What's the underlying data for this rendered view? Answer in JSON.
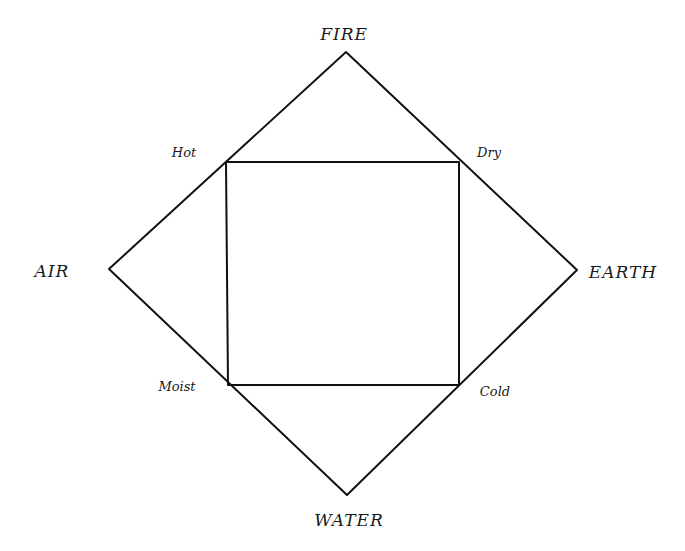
{
  "diagram": {
    "type": "square-of-opposition / four elements diagram",
    "stroke_color": "#111111",
    "background": "#ffffff",
    "elements": [
      {
        "id": "fire",
        "label": "FIRE",
        "position": "top",
        "vertex": [
          346,
          52
        ],
        "label_pos": [
          344,
          40
        ]
      },
      {
        "id": "air",
        "label": "AIR",
        "position": "left",
        "vertex": [
          109,
          269
        ],
        "label_pos": [
          52,
          277
        ]
      },
      {
        "id": "earth",
        "label": "EARTH",
        "position": "right",
        "vertex": [
          577,
          270
        ],
        "label_pos": [
          623,
          278
        ]
      },
      {
        "id": "water",
        "label": "WATER",
        "position": "bottom",
        "vertex": [
          347,
          495
        ],
        "label_pos": [
          349,
          526
        ]
      }
    ],
    "qualities": [
      {
        "id": "hot",
        "label": "Hot",
        "corner": [
          226,
          162
        ],
        "label_pos": [
          184,
          157
        ]
      },
      {
        "id": "dry",
        "label": "Dry",
        "corner": [
          459,
          162
        ],
        "label_pos": [
          489,
          157
        ]
      },
      {
        "id": "moist",
        "label": "Moist",
        "corner": [
          228,
          385
        ],
        "label_pos": [
          177,
          391
        ]
      },
      {
        "id": "cold",
        "label": "Cold",
        "corner": [
          459,
          385
        ],
        "label_pos": [
          495,
          396
        ]
      }
    ]
  }
}
